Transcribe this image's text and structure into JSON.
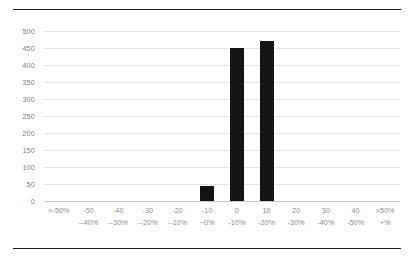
{
  "chart_data": {
    "type": "bar",
    "title": "",
    "subtitle": "",
    "xlabel": "",
    "ylabel": "",
    "ylim": [
      0,
      500
    ],
    "ytick_step": 50,
    "yticks": [
      500,
      450,
      400,
      350,
      300,
      250,
      200,
      150,
      100,
      50,
      0
    ],
    "grid": true,
    "legend": "none",
    "bar_color": "#141414",
    "grid_color": "#e4e4e4",
    "axis_color": "#c9c9c9",
    "label_color": "#8a8a8a",
    "rule_color": "#1d1d1d",
    "categories": [
      ">-50%\n--40%",
      "-50\n--40%",
      "-40\n--30%",
      "-30\n--20%",
      "-20\n--10%",
      "-10\n~0%",
      "0\n-10%",
      "10\n-20%",
      "20\n-30%",
      "30\n-40%",
      "40\n-50%",
      ">50%\n+%"
    ],
    "category_lines": [
      {
        "line1": ">-50%",
        "line2": ""
      },
      {
        "line1": "-50",
        "line2": "--40%"
      },
      {
        "line1": "-40",
        "line2": "--30%"
      },
      {
        "line1": "-30",
        "line2": "--20%"
      },
      {
        "line1": "-20",
        "line2": "--10%"
      },
      {
        "line1": "-10",
        "line2": "~0%"
      },
      {
        "line1": "0",
        "line2": "-10%"
      },
      {
        "line1": "10",
        "line2": "-20%"
      },
      {
        "line1": "20",
        "line2": "-30%"
      },
      {
        "line1": "30",
        "line2": "-40%"
      },
      {
        "line1": "40",
        "line2": "-50%"
      },
      {
        "line1": ">50%",
        "line2": "+%"
      }
    ],
    "values": [
      0,
      0,
      0,
      0,
      0,
      45,
      450,
      470,
      0,
      0,
      0,
      0
    ]
  }
}
